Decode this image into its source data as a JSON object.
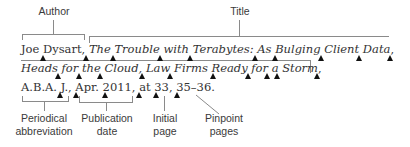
{
  "diagram": {
    "top_labels": {
      "author": "Author",
      "title": "Title"
    },
    "citation": {
      "line1_plain": "Joe Dysart, ",
      "line1_italic": "The Trouble with Terabytes: As Bulging Client Data",
      "line2_italic": "Heads for the Cloud, Law Firms Ready for a Storm",
      "line2_tail": ",",
      "line3": "A.B.A. J., Apr. 2011, at 33, 35–36."
    },
    "bottom_labels": {
      "periodical": [
        "Periodical",
        "abbreviation"
      ],
      "publication_date": [
        "Publication",
        "date"
      ],
      "initial_page": [
        "Initial",
        "page"
      ],
      "pinpoint_pages": [
        "Pinpoint",
        "pages"
      ]
    },
    "space_marker": "solid black triangle indicating a required space",
    "colors": {
      "text": "#333333",
      "bracket": "#8a8a8a",
      "marker": "#111111"
    }
  }
}
